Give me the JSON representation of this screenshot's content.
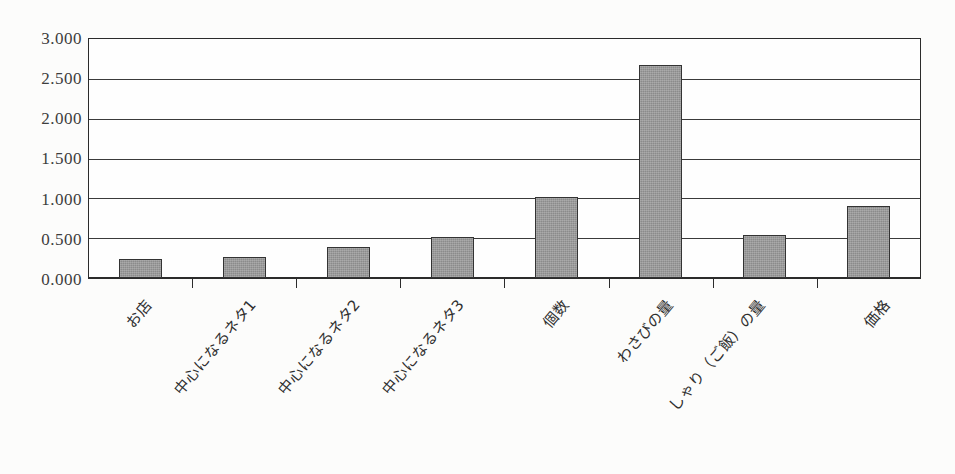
{
  "chart_data": {
    "type": "bar",
    "title": "",
    "subtitle": "",
    "xlabel": "",
    "ylabel": "",
    "ylim": [
      0,
      3.0
    ],
    "ytick_step": 0.5,
    "grid": true,
    "legend": null,
    "categories": [
      "お店",
      "中心になるネタ1",
      "中心になるネタ2",
      "中心になるネタ3",
      "個数",
      "わさびの量",
      "しゃり（ご飯）の量",
      "価格"
    ],
    "values": [
      0.24,
      0.26,
      0.39,
      0.51,
      1.02,
      2.67,
      0.54,
      0.91
    ],
    "ytick_labels": [
      "0.000",
      "0.500",
      "1.000",
      "1.500",
      "2.000",
      "2.500",
      "3.000"
    ],
    "ytick_values": [
      0.0,
      0.5,
      1.0,
      1.5,
      2.0,
      2.5,
      3.0
    ],
    "series": [
      {
        "name": "",
        "values": [
          0.24,
          0.26,
          0.39,
          0.51,
          1.02,
          2.67,
          0.54,
          0.91
        ]
      }
    ],
    "colors": {
      "bar_fill": "#8b8b8b",
      "bar_border": "#333333",
      "gridline": "#3a3a3a",
      "axis": "#2b2b2b",
      "text": "#2f2f2f",
      "background": "#fcfcfb"
    }
  }
}
